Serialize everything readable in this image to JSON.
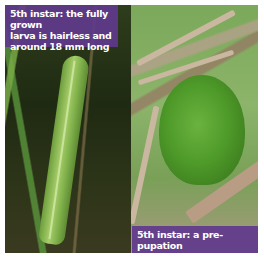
{
  "photos": [
    {
      "subject": "long green hairless larva on grass blade",
      "caption": "5th instar: the fully grown larva is hairless and around 18 mm long",
      "caption_lines": [
        "5th instar: the fully grown",
        "larva is hairless and",
        "around 18 mm long"
      ]
    },
    {
      "subject": "curled green pre-pupation larva among dry stems",
      "caption": "5th instar: a pre-pupation larva",
      "caption_lines": [
        "5th instar: a pre-pupation",
        "larva"
      ]
    }
  ],
  "colors": {
    "caption_bg": "#603a8c",
    "caption_text": "#ffffff",
    "border": "#ffffff"
  }
}
